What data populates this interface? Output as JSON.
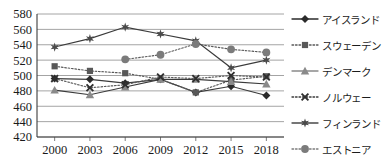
{
  "chart_data": {
    "type": "line",
    "title": "",
    "xlabel": "",
    "ylabel": "",
    "categories": [
      "2000",
      "2003",
      "2006",
      "2009",
      "2012",
      "2015",
      "2018"
    ],
    "x_tick_labels": [
      "2000",
      "2003",
      "2006",
      "2009",
      "2012",
      "2015",
      "2018"
    ],
    "y_tick_labels": [
      "580",
      "560",
      "540",
      "520",
      "500",
      "480",
      "460",
      "440",
      "420"
    ],
    "y_ticks": [
      580,
      560,
      540,
      520,
      500,
      480,
      460,
      440,
      420
    ],
    "ylim": [
      420,
      580
    ],
    "grid": "horizontal",
    "legend_position": "right",
    "series": [
      {
        "name": "アイスランド",
        "marker": "diamond",
        "line_style": "solid",
        "color": "#2b2b2b",
        "values": [
          496,
          495,
          490,
          495,
          478,
          486,
          474
        ]
      },
      {
        "name": "スウェーデン",
        "marker": "square",
        "line_style": "dotted",
        "color": "#585858",
        "values": [
          512,
          506,
          503,
          495,
          478,
          494,
          499
        ]
      },
      {
        "name": "デンマーク",
        "marker": "triangle",
        "line_style": "solid",
        "color": "#8a8a8a",
        "values": [
          481,
          475,
          485,
          495,
          495,
          492,
          489
        ]
      },
      {
        "name": "ノルウェー",
        "marker": "x",
        "line_style": "dotted",
        "color": "#3a3a3a",
        "values": [
          496,
          484,
          488,
          498,
          496,
          500,
          498
        ]
      },
      {
        "name": "フィンランド",
        "marker": "star",
        "line_style": "solid",
        "color": "#4a4a4a",
        "values": [
          537,
          548,
          563,
          554,
          545,
          510,
          520
        ]
      },
      {
        "name": "エストニア",
        "marker": "circle",
        "line_style": "dotted",
        "color": "#7b7b7b",
        "values": [
          null,
          null,
          521,
          527,
          541,
          534,
          530
        ]
      }
    ]
  }
}
